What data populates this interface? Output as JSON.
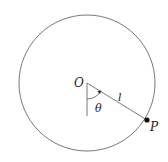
{
  "diagram": {
    "labels": {
      "center": "O",
      "point": "P",
      "length": "l",
      "angle": "θ"
    },
    "colors": {
      "stroke": "#444444",
      "point": "#111111"
    }
  }
}
